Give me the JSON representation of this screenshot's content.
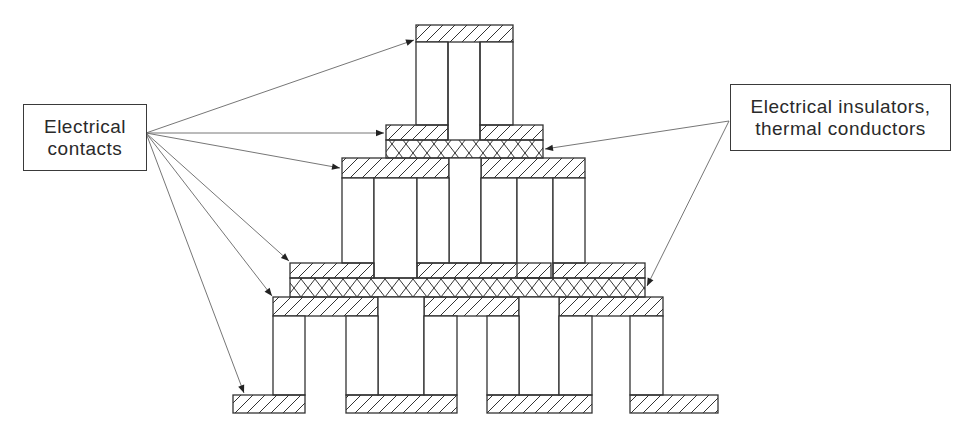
{
  "diagram": {
    "type": "multistage thermoelectric cooler cross-section",
    "labels": {
      "contacts": {
        "line1": "Electrical",
        "line2": "contacts"
      },
      "insulators": {
        "line1": "Electrical insulators,",
        "line2": "thermal conductors"
      }
    },
    "legend_patterns": {
      "diagonal_hatch": "electrical contact",
      "cross_hatch": "electrical insulator / thermal conductor",
      "blank": "thermoelectric element"
    },
    "colors": {
      "stroke": "#333333",
      "arrow": "#555555",
      "background": "#ffffff"
    },
    "stages": 3
  }
}
